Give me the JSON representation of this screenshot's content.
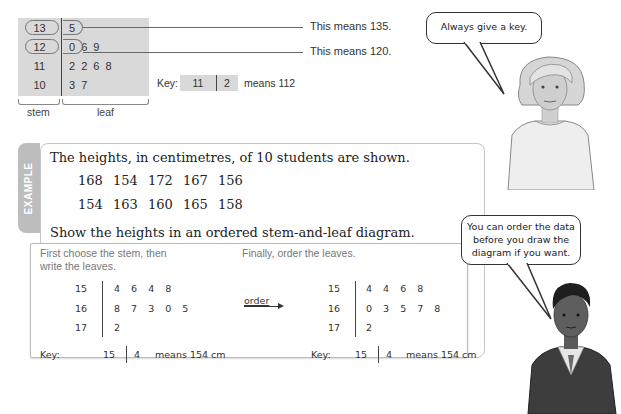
{
  "stem_leaf_example": {
    "rows": [
      {
        "stem": "13",
        "leaves": "5"
      },
      {
        "stem": "12",
        "leaves": "0 6 9"
      },
      {
        "stem": "11",
        "leaves": "2 2 6 8"
      },
      {
        "stem": "10",
        "leaves": "3 7"
      }
    ],
    "annotations": [
      "This means 135.",
      "This means 120."
    ],
    "brace_labels": {
      "stem": "stem",
      "leaf": "leaf"
    },
    "key": {
      "label": "Key:",
      "stem": "11",
      "leaf": "2",
      "means": "means 112"
    }
  },
  "teacher_bubble": {
    "text": "Always give a key."
  },
  "student_bubble": {
    "lines": [
      "You can order the data",
      "before you draw the",
      "diagram if you want."
    ]
  },
  "example": {
    "tab_label": "EXAMPLE",
    "intro": "The heights, in centimetres, of 10 students are shown.",
    "data_rows": [
      [
        "168",
        "154",
        "172",
        "167",
        "156"
      ],
      [
        "154",
        "163",
        "160",
        "165",
        "158"
      ]
    ],
    "task": "Show the heights in an ordered stem-and-leaf diagram.",
    "step1": {
      "heading_lines": [
        "First choose the stem, then",
        "write the leaves."
      ],
      "rows": [
        {
          "stem": "15",
          "leaves": "4 6 4 8"
        },
        {
          "stem": "16",
          "leaves": "8 7 3 0 5"
        },
        {
          "stem": "17",
          "leaves": "2"
        }
      ],
      "key": {
        "label": "Key:",
        "stem": "15",
        "leaf": "4",
        "means": "means 154 cm"
      }
    },
    "order_label": "order",
    "step2": {
      "heading": "Finally, order the leaves.",
      "rows": [
        {
          "stem": "15",
          "leaves": "4 4 6 8"
        },
        {
          "stem": "16",
          "leaves": "0 3 5 7 8"
        },
        {
          "stem": "17",
          "leaves": "2"
        }
      ],
      "key": {
        "label": "Key:",
        "stem": "15",
        "leaf": "4",
        "means": "means 154 cm"
      }
    }
  },
  "colors": {
    "diagram_fill": "#d9d9d9",
    "tab_fill": "#bdbdbd",
    "panel_border": "#c6c6c6"
  }
}
